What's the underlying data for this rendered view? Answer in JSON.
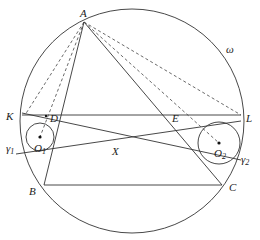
{
  "figure": {
    "type": "geometry",
    "colors": {
      "stroke": "#333333",
      "background": "#ffffff"
    },
    "circles": {
      "omega": {
        "label": "ω",
        "cx": 132,
        "cy": 121,
        "r": 112
      },
      "gamma1": {
        "label": "γ",
        "sub": "1",
        "cx": 40,
        "cy": 137,
        "r": 14
      },
      "gamma2": {
        "label": "γ",
        "sub": "2",
        "cx": 219,
        "cy": 143,
        "r": 21
      }
    },
    "points": {
      "A": {
        "label": "A",
        "x": 84,
        "y": 22
      },
      "K": {
        "label": "K",
        "x": 22,
        "y": 115
      },
      "L": {
        "label": "L",
        "x": 241,
        "y": 115
      },
      "D": {
        "label": "D",
        "x": 46,
        "y": 116
      },
      "E": {
        "label": "E",
        "x": 178,
        "y": 116
      },
      "B": {
        "label": "B",
        "x": 44,
        "y": 185
      },
      "C": {
        "label": "C",
        "x": 222,
        "y": 185
      },
      "O1": {
        "label": "O",
        "sub": "1",
        "x": 40,
        "y": 137
      },
      "O2": {
        "label": "O",
        "sub": "2",
        "x": 219,
        "y": 143
      },
      "X": {
        "label": "X",
        "x": 116,
        "y": 141
      }
    },
    "labels": {
      "A": "A",
      "K": "K",
      "L": "L",
      "D": "D",
      "E": "E",
      "B": "B",
      "C": "C",
      "X": "X",
      "O": "O",
      "one": "1",
      "two": "2",
      "omega": "ω",
      "gamma": "γ"
    }
  }
}
